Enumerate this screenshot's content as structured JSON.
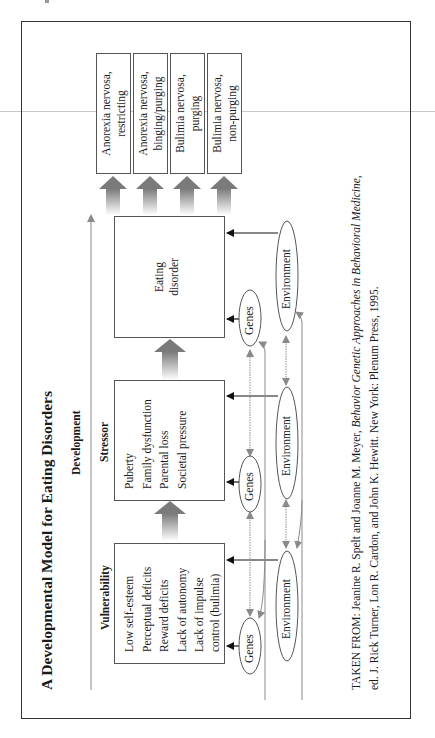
{
  "title": "A Developmental Model for Eating Disorders",
  "development_label": "Development",
  "stages": {
    "vulnerability": {
      "heading": "Vulnerability",
      "items": [
        "Low self-esteem",
        "Perceptual deficits",
        "Reward deficits",
        "Lack of autonomy",
        "Lack of impulse",
        "control (bulimia)"
      ]
    },
    "stressor": {
      "heading": "Stressor",
      "items": [
        "Puberty",
        "Family dysfunction",
        "Parental loss",
        "Societal pressure"
      ]
    },
    "eating_disorder": {
      "lines": [
        "Eating",
        "disorder"
      ]
    }
  },
  "outcomes": [
    {
      "lines": [
        "Anorexia nervosa,",
        "restricting"
      ]
    },
    {
      "lines": [
        "Anorexia nervosa,",
        "binging/purging"
      ]
    },
    {
      "lines": [
        "Bulimia nervosa,",
        "purging"
      ]
    },
    {
      "lines": [
        "Bulimia nervosa,",
        "non-purging"
      ]
    }
  ],
  "influences": {
    "genes_label": "Genes",
    "environment_label": "Environment"
  },
  "citation": {
    "prefix": "TAKEN FROM: Jeanine R. Spelt and Joanne M. Meyer, ",
    "book_title": "Behavior Genetic Approaches in Behavioral Medicine",
    "line1_suffix": ",",
    "line2": "ed. J. Rick Turner, Lon R. Cardon, and John K. Hewitt. New York: Plenum Press, 1995."
  },
  "colors": {
    "frame": "#333333",
    "box_border": "#555555",
    "influence_arrow": "#111111",
    "feedback_arrow": "#8a8a8a",
    "gradient_arrow_top": "#7a7a7a"
  }
}
